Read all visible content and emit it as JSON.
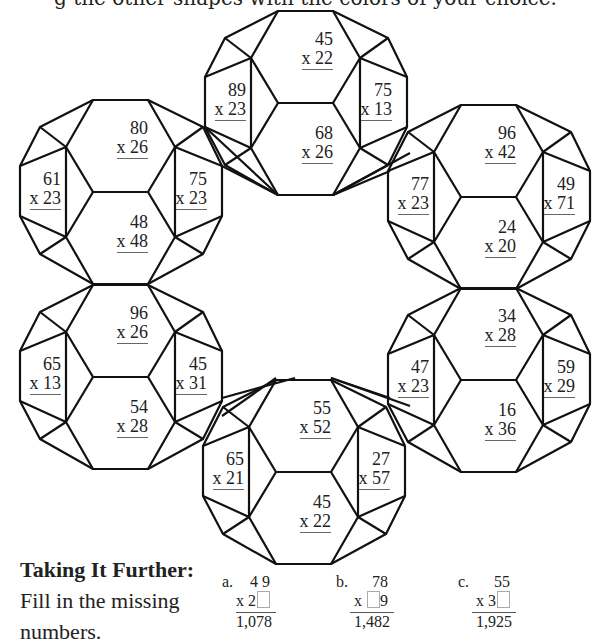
{
  "instruction": "g the other shapes with the colors of your choice.",
  "shapes": [
    {
      "name": "top",
      "offset": [
        0,
        0
      ],
      "problems": [
        {
          "pos": "top",
          "a": "45",
          "b": "x 22"
        },
        {
          "pos": "left",
          "a": "89",
          "b": "x 23"
        },
        {
          "pos": "right",
          "a": "75",
          "b": "x 13"
        },
        {
          "pos": "bottom",
          "a": "68",
          "b": "x 26"
        }
      ]
    },
    {
      "name": "upper-left",
      "offset": [
        -185,
        89
      ],
      "problems": [
        {
          "pos": "top",
          "a": "80",
          "b": "x 26"
        },
        {
          "pos": "left",
          "a": "61",
          "b": "x 23"
        },
        {
          "pos": "right",
          "a": "75",
          "b": "x 23"
        },
        {
          "pos": "bottom",
          "a": "48",
          "b": "x 48"
        }
      ]
    },
    {
      "name": "upper-right",
      "offset": [
        183,
        94
      ],
      "problems": [
        {
          "pos": "top",
          "a": "96",
          "b": "x 42"
        },
        {
          "pos": "left",
          "a": "77",
          "b": "x 23"
        },
        {
          "pos": "right",
          "a": "49",
          "b": "x 71"
        },
        {
          "pos": "bottom",
          "a": "24",
          "b": "x 20"
        }
      ]
    },
    {
      "name": "lower-left",
      "offset": [
        -185,
        274
      ],
      "problems": [
        {
          "pos": "top",
          "a": "96",
          "b": "x 26"
        },
        {
          "pos": "left",
          "a": "65",
          "b": "x 13"
        },
        {
          "pos": "right",
          "a": "45",
          "b": "x 31"
        },
        {
          "pos": "bottom",
          "a": "54",
          "b": "x 28"
        }
      ]
    },
    {
      "name": "lower-right",
      "offset": [
        183,
        277
      ],
      "problems": [
        {
          "pos": "top",
          "a": "34",
          "b": "x 28"
        },
        {
          "pos": "left",
          "a": "47",
          "b": "x 23"
        },
        {
          "pos": "right",
          "a": "59",
          "b": "x 29"
        },
        {
          "pos": "bottom",
          "a": "16",
          "b": "x 36"
        }
      ]
    },
    {
      "name": "bottom",
      "offset": [
        -2,
        369
      ],
      "problems": [
        {
          "pos": "top",
          "a": "55",
          "b": "x 52"
        },
        {
          "pos": "left",
          "a": "65",
          "b": "x 21"
        },
        {
          "pos": "right",
          "a": "27",
          "b": "x 57"
        },
        {
          "pos": "bottom",
          "a": "45",
          "b": "x 22"
        }
      ]
    }
  ],
  "taking_further": {
    "title": "Taking It Further:",
    "line1": "Fill in the missing",
    "line2": "numbers.",
    "questions": [
      {
        "label": "a.",
        "top": "4 9",
        "mult_prefix": "x 2",
        "mult_suffix": "",
        "box_position": "end",
        "answer": "1,078"
      },
      {
        "label": "b.",
        "top": "78",
        "mult_prefix": "x ",
        "mult_suffix": "9",
        "box_position": "middle",
        "answer": "1,482"
      },
      {
        "label": "c.",
        "top": "55",
        "mult_prefix": "x 3",
        "mult_suffix": "",
        "box_position": "end",
        "answer": "1,925"
      }
    ]
  },
  "colors": {
    "line": "#111111",
    "text": "#222222",
    "background": "#ffffff"
  }
}
